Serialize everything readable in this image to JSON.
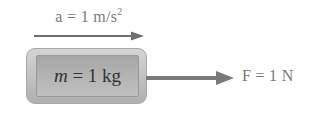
{
  "diagram": {
    "acceleration": {
      "symbol": "a",
      "equals": "=",
      "value": "1",
      "unit": "m/s",
      "exponent": "2",
      "direction": "right"
    },
    "mass_block": {
      "symbol": "m",
      "equals": "=",
      "value": "1 kg"
    },
    "force": {
      "label": "F = 1 N",
      "direction": "right"
    },
    "colors": {
      "arrow": "#6e6e6e",
      "block_outer": "#bdbdbd",
      "block_inner": "#b2b2b2",
      "text": "#333333"
    }
  }
}
